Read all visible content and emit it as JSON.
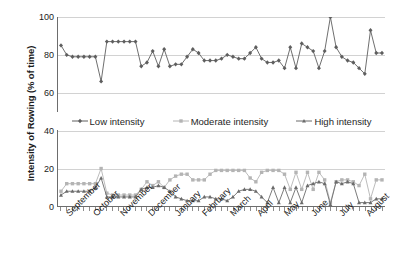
{
  "chart_data": {
    "type": "line",
    "title": "",
    "subtitle": "",
    "xlabel": "",
    "ylabel": "Intensity of Rowing (% of time)",
    "ylim": [
      0,
      100
    ],
    "yticks": [
      0,
      20,
      40,
      60,
      80,
      100
    ],
    "grid": true,
    "legend_position": "center",
    "x_tick_labels": [
      "September",
      "October",
      "November",
      "December",
      "January",
      "February",
      "March",
      "April",
      "May",
      "June",
      "July",
      "August"
    ],
    "x_note": "52 weekly observations spanning September through August",
    "n_points": 52,
    "series": [
      {
        "name": "Low intensity",
        "color": "#5e5e5e",
        "marker": "diamond",
        "values": [
          85,
          80,
          79,
          79,
          79,
          79,
          79,
          66,
          87,
          87,
          87,
          87,
          87,
          87,
          74,
          76,
          82,
          74,
          83,
          74,
          75,
          75,
          79,
          83,
          81,
          77,
          77,
          77,
          78,
          80,
          79,
          78,
          78,
          81,
          84,
          78,
          76,
          76,
          77,
          73,
          84,
          73,
          86,
          84,
          82,
          73,
          82,
          100,
          84,
          79,
          77,
          76,
          73,
          70,
          93,
          81,
          81
        ]
      },
      {
        "name": "Moderate intensity",
        "color": "#b4b4b4",
        "marker": "square",
        "values": [
          8,
          12,
          12,
          12,
          12,
          12,
          12,
          20,
          7,
          6,
          6,
          6,
          6,
          6,
          9,
          13,
          11,
          13,
          10,
          14,
          16,
          17,
          17,
          14,
          14,
          14,
          17,
          19,
          19,
          19,
          19,
          19,
          19,
          15,
          13,
          18,
          19,
          19,
          19,
          17,
          9,
          18,
          9,
          18,
          9,
          18,
          14,
          2,
          13,
          14,
          14,
          13,
          11,
          17,
          4,
          14,
          14
        ]
      },
      {
        "name": "High intensity",
        "color": "#6b6b6b",
        "marker": "triangle",
        "values": [
          6,
          8,
          8,
          8,
          8,
          8,
          10,
          15,
          5,
          5,
          5,
          5,
          5,
          5,
          9,
          10,
          10,
          11,
          10,
          8,
          5,
          4,
          3,
          3,
          3,
          5,
          5,
          4,
          4,
          3,
          5,
          8,
          9,
          9,
          8,
          5,
          2,
          10,
          2,
          10,
          2,
          10,
          2,
          11,
          12,
          13,
          12,
          1,
          13,
          12,
          13,
          12,
          2,
          2,
          2,
          4,
          4
        ]
      }
    ]
  },
  "legend": {
    "items": [
      {
        "label": "Low intensity"
      },
      {
        "label": "Moderate intensity"
      },
      {
        "label": "High intensity"
      }
    ]
  }
}
